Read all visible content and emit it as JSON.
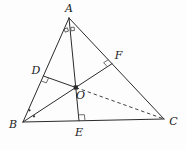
{
  "figure": {
    "background": "#fdfdfd",
    "stroke_color": "#2b2b2b",
    "mark_color": "#4a4a4a",
    "label_color": "#1a1a1a",
    "width": 186,
    "height": 150,
    "points": {
      "A": [
        69,
        18
      ],
      "B": [
        23,
        122
      ],
      "C": [
        164,
        119
      ],
      "D": [
        43.4,
        76
      ],
      "E": [
        79,
        120.8
      ],
      "F": [
        112,
        63.7
      ],
      "O": [
        75.8,
        87.5
      ]
    },
    "labels": [
      {
        "text": "A",
        "x": 69,
        "y": 8.5,
        "name": "vertex-label-A"
      },
      {
        "text": "B",
        "x": 13,
        "y": 124.5,
        "name": "vertex-label-B"
      },
      {
        "text": "C",
        "x": 173.5,
        "y": 121.5,
        "name": "vertex-label-C"
      },
      {
        "text": "D",
        "x": 36,
        "y": 70,
        "name": "point-label-D"
      },
      {
        "text": "E",
        "x": 79,
        "y": 132.5,
        "name": "point-label-E"
      },
      {
        "text": "F",
        "x": 118.5,
        "y": 55.5,
        "name": "point-label-F"
      },
      {
        "text": "O",
        "x": 80.5,
        "y": 95.5,
        "name": "point-label-O"
      }
    ],
    "solid_segments": [
      {
        "from": "A",
        "to": "B",
        "name": "side-AB"
      },
      {
        "from": "A",
        "to": "C",
        "name": "side-AC"
      },
      {
        "from": "B",
        "to": "C",
        "name": "side-BC"
      },
      {
        "from": "A",
        "to": "E",
        "name": "altitude-AE"
      },
      {
        "from": "B",
        "to": "F",
        "name": "altitude-BF"
      },
      {
        "from": "D",
        "to": "O",
        "name": "segment-DO"
      }
    ],
    "dashed_segments": [
      {
        "from": "O",
        "to": "C",
        "name": "dashed-segment-OC",
        "dash": "3.5 2.8"
      }
    ],
    "right_angle_marks": [
      {
        "at": "E",
        "toward": [
          "A",
          "C"
        ],
        "size": 6,
        "name": "right-angle-mark-E"
      },
      {
        "at": "D",
        "toward": [
          "B",
          "O"
        ],
        "size": 5.5,
        "name": "right-angle-mark-D"
      },
      {
        "at": "F",
        "toward": [
          "A",
          "B"
        ],
        "size": 5.5,
        "name": "right-angle-mark-F"
      }
    ],
    "equal_angle_squares": [
      {
        "cx": 66.3,
        "cy": 30,
        "size": 3.4,
        "rotate": -18,
        "name": "equal-angle-square-A-left"
      },
      {
        "cx": 72.6,
        "cy": 29,
        "size": 3.4,
        "rotate": -5,
        "name": "equal-angle-square-A-right"
      }
    ],
    "equal_angle_dots": [
      {
        "cx": 29.5,
        "cy": 110.3,
        "r": 1.1,
        "name": "equal-angle-dot-B-upper"
      },
      {
        "cx": 34,
        "cy": 116.3,
        "r": 1.1,
        "name": "equal-angle-dot-B-lower"
      }
    ],
    "point_marker": {
      "at": "O",
      "shape": "filled-square",
      "size": 4.2,
      "name": "point-marker-O"
    }
  }
}
